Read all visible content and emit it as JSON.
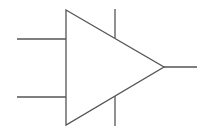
{
  "diagram": {
    "type": "op-amp-symbol",
    "stroke_color": "#555555",
    "fill_color": "#ffffff",
    "stroke_width": 1.3,
    "triangle": {
      "points": "66,10 164,67 66,125"
    },
    "inputs": [
      {
        "name": "input-1",
        "x1": 17,
        "y1": 39,
        "x2": 66,
        "y2": 39
      },
      {
        "name": "input-2",
        "x1": 17,
        "y1": 97,
        "x2": 66,
        "y2": 97
      }
    ],
    "output": {
      "x1": 164,
      "y1": 67,
      "x2": 197,
      "y2": 67
    },
    "supply": [
      {
        "name": "supply-positive",
        "x1": 115,
        "y1": 9,
        "x2": 115,
        "y2": 38
      },
      {
        "name": "supply-negative",
        "x1": 115,
        "y1": 96,
        "x2": 115,
        "y2": 126
      }
    ]
  }
}
